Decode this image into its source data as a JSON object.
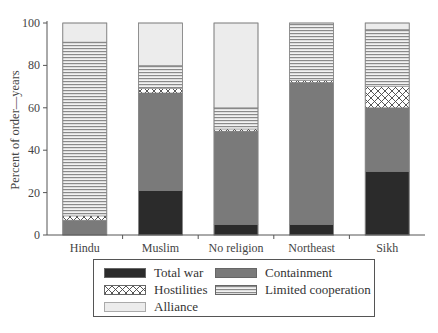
{
  "chart_data": {
    "type": "bar",
    "stacked": true,
    "title": "",
    "xlabel": "",
    "ylabel": "Percent of order—years",
    "ylim": [
      0,
      100
    ],
    "yticks": [
      0,
      20,
      40,
      60,
      80,
      100
    ],
    "grid": false,
    "legend_position": "bottom",
    "categories": [
      "Hindu",
      "Muslim",
      "No religion",
      "Northeast",
      "Sikh"
    ],
    "series": [
      {
        "name": "Total war",
        "values": [
          0,
          21,
          5,
          5,
          30
        ],
        "color": "#2b2b2b",
        "pattern": "solid"
      },
      {
        "name": "Containment",
        "values": [
          7,
          46,
          44,
          67,
          30
        ],
        "color": "#7a7a7a",
        "pattern": "solid"
      },
      {
        "name": "Hostilities",
        "values": [
          2,
          2,
          1,
          1,
          10
        ],
        "color": "#ffffff",
        "pattern": "crosshatch"
      },
      {
        "name": "Limited cooperation",
        "values": [
          82,
          11,
          10,
          27,
          27
        ],
        "color": "#a8a8a8",
        "pattern": "horizontal-lines"
      },
      {
        "name": "Alliance",
        "values": [
          9,
          20,
          40,
          0,
          3
        ],
        "color": "#ececec",
        "pattern": "solid"
      }
    ]
  },
  "legend": {
    "items": [
      {
        "label": "Total war"
      },
      {
        "label": "Containment"
      },
      {
        "label": "Hostilities"
      },
      {
        "label": "Limited cooperation"
      },
      {
        "label": "Alliance"
      }
    ]
  }
}
